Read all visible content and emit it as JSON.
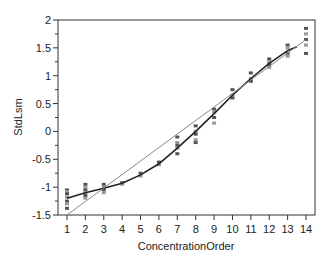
{
  "chart_data": {
    "type": "scatter",
    "title": "",
    "xlabel": "ConcentrationOrder",
    "ylabel": "StdLsm",
    "xlim": [
      0.5,
      14.5
    ],
    "ylim": [
      -1.5,
      2
    ],
    "x_ticks": [
      1,
      2,
      3,
      4,
      5,
      6,
      7,
      8,
      9,
      10,
      11,
      12,
      13,
      14
    ],
    "x_tick_labels": [
      "1",
      "2",
      "3",
      "4",
      "5",
      "6",
      "7",
      "8",
      "9",
      "10",
      "11",
      "12",
      "13",
      "14"
    ],
    "y_ticks": [
      -1.5,
      -1,
      -0.5,
      0,
      0.5,
      1,
      1.5,
      2
    ],
    "y_tick_labels": [
      "-1.5",
      "-1",
      "-0.5",
      "0",
      "0.5",
      "1",
      "1.5",
      "2"
    ],
    "grid": false,
    "legend": "none",
    "points": {
      "1": [
        -1.05,
        -1.08,
        -1.12,
        -1.18,
        -1.25,
        -1.3,
        -1.38
      ],
      "2": [
        -0.95,
        -1.0,
        -1.05,
        -1.1,
        -1.15,
        -1.2
      ],
      "3": [
        -0.95,
        -1.0,
        -1.05,
        -1.1
      ],
      "4": [
        -0.92,
        -0.95
      ],
      "5": [
        -0.75,
        -0.8
      ],
      "6": [
        -0.55,
        -0.6
      ],
      "7": [
        -0.1,
        -0.2,
        -0.25,
        -0.3,
        -0.4
      ],
      "8": [
        0.1,
        0.0,
        -0.05,
        -0.15,
        -0.2
      ],
      "9": [
        0.4,
        0.35,
        0.25,
        0.15
      ],
      "10": [
        0.75,
        0.65,
        0.6
      ],
      "11": [
        1.05,
        0.95,
        0.9
      ],
      "12": [
        1.3,
        1.25,
        1.2,
        1.15
      ],
      "13": [
        1.55,
        1.5,
        1.4,
        1.35
      ],
      "14": [
        1.85,
        1.75,
        1.65,
        1.55,
        1.4
      ]
    },
    "series": [
      {
        "name": "smooth fit",
        "style": "thick-dark",
        "x": [
          1,
          2,
          3,
          4,
          5,
          6,
          7,
          8,
          9,
          10,
          11,
          12,
          13,
          13.5
        ],
        "values": [
          -1.2,
          -1.1,
          -1.02,
          -0.93,
          -0.78,
          -0.58,
          -0.3,
          0.0,
          0.32,
          0.65,
          0.95,
          1.22,
          1.45,
          1.52
        ]
      },
      {
        "name": "linear fit",
        "style": "thin-gray",
        "x": [
          1,
          14
        ],
        "values": [
          -1.5,
          1.65
        ]
      }
    ]
  }
}
